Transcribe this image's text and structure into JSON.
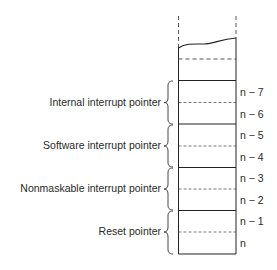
{
  "diagram": {
    "groups": [
      {
        "label": "Internal interrupt pointer",
        "addresses": [
          "n − 7",
          "n − 6"
        ]
      },
      {
        "label": "Software interrupt pointer",
        "addresses": [
          "n − 5",
          "n − 4"
        ]
      },
      {
        "label": "Nonmaskable interrupt pointer",
        "addresses": [
          "n − 3",
          "n − 2"
        ]
      },
      {
        "label": "Reset pointer",
        "addresses": [
          "n − 1",
          "n"
        ]
      }
    ]
  }
}
